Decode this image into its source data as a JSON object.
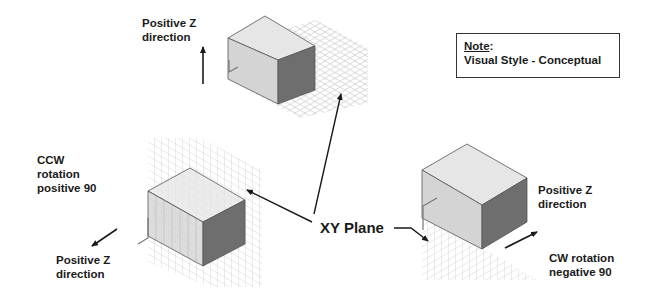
{
  "diagram": {
    "note": {
      "title": "Note",
      "title_suffix": ":",
      "text": "Visual Style - Conceptual"
    },
    "center_label": "XY Plane",
    "views": [
      {
        "id": "top",
        "label_lines": [
          "Positive Z",
          "direction"
        ],
        "arrow": "up"
      },
      {
        "id": "bottom-left",
        "rotation_lines": [
          "CCW",
          "rotation",
          "positive 90"
        ],
        "label_lines": [
          "Positive Z",
          "direction"
        ],
        "arrow": "down-left"
      },
      {
        "id": "bottom-right",
        "label_lines": [
          "Positive Z",
          "direction"
        ],
        "rotation_lines": [
          "CW rotation",
          "negative 90"
        ],
        "arrow": "up-right"
      }
    ],
    "colors": {
      "box_top": "#e4e4e4",
      "box_front": "#d2d2d2",
      "box_side": "#6e6e6e",
      "box_edge": "#555555",
      "grid": "#b8b8b8",
      "arrow": "#1a1a1a",
      "text": "#1a1a1a"
    }
  }
}
